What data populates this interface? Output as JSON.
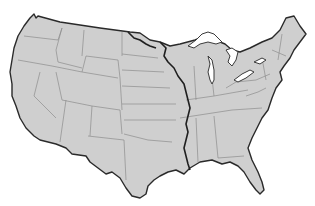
{
  "map": {
    "subject": "Contiguous United States outline map",
    "style": "grayscale",
    "colors": {
      "background": "#ffffff",
      "land": "#cfcfcf",
      "coastline": "#2a2a2a",
      "state_borders": "#8d8d8d",
      "river": "#1f1f1f",
      "lakes": "#ffffff"
    },
    "features": [
      {
        "type": "coastline",
        "name": "national-outline"
      },
      {
        "type": "borders",
        "name": "state-boundaries"
      },
      {
        "type": "river",
        "name": "mississippi-river"
      },
      {
        "type": "lakes",
        "name": "great-lakes"
      }
    ]
  }
}
